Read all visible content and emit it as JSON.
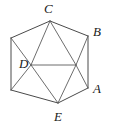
{
  "figure": {
    "name": "labeled-hexagon-with-diagonals",
    "type": "geometry-diagram",
    "shape": "hexagon",
    "stroke_color": "#4a4a4a",
    "label_color": "#1a1a1a",
    "background_color": "#ffffff",
    "width": 115,
    "height": 129,
    "vertices": [
      {
        "id": "C",
        "label": "C",
        "x": 50,
        "y": 21,
        "label_x": 44,
        "label_y": 2,
        "labeled": true
      },
      {
        "id": "B",
        "label": "B",
        "x": 88,
        "y": 36,
        "label_x": 93,
        "label_y": 25,
        "labeled": true
      },
      {
        "id": "A",
        "label": "A",
        "x": 88,
        "y": 88,
        "label_x": 93,
        "label_y": 82,
        "labeled": true
      },
      {
        "id": "E",
        "label": "E",
        "x": 58,
        "y": 103,
        "label_x": 54,
        "label_y": 110,
        "labeled": true
      },
      {
        "id": "V5",
        "label": "",
        "x": 11,
        "y": 90,
        "label_x": 0,
        "label_y": 0,
        "labeled": false
      },
      {
        "id": "V6",
        "label": "",
        "x": 11,
        "y": 38,
        "label_x": 0,
        "label_y": 0,
        "labeled": false
      }
    ],
    "interior_points": [
      {
        "id": "D",
        "label": "D",
        "x": 31,
        "y": 65,
        "label_x": 19,
        "label_y": 57,
        "labeled": true
      },
      {
        "id": "P",
        "label": "",
        "x": 76,
        "y": 65,
        "label_x": 0,
        "label_y": 0,
        "labeled": false
      }
    ],
    "outline_edges": [
      {
        "from": "V6",
        "to": "C"
      },
      {
        "from": "C",
        "to": "B"
      },
      {
        "from": "B",
        "to": "A"
      },
      {
        "from": "A",
        "to": "E"
      },
      {
        "from": "E",
        "to": "V5"
      },
      {
        "from": "V5",
        "to": "V6"
      }
    ],
    "chords": [
      {
        "from": "C",
        "to": "D"
      },
      {
        "from": "C",
        "to": "P"
      },
      {
        "from": "D",
        "to": "P"
      },
      {
        "from": "D",
        "to": "E"
      },
      {
        "from": "P",
        "to": "E"
      },
      {
        "from": "V6",
        "to": "D"
      },
      {
        "from": "D",
        "to": "V5"
      },
      {
        "from": "B",
        "to": "P"
      },
      {
        "from": "P",
        "to": "A"
      }
    ]
  }
}
